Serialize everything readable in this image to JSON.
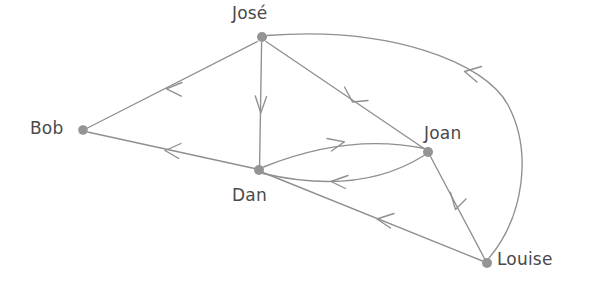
{
  "diagram": {
    "type": "directed-graph",
    "title": "",
    "canvas": {
      "width": 590,
      "height": 289
    },
    "style": {
      "background_color": "#ffffff",
      "node_color": "#949494",
      "edge_color": "#8f8f8f",
      "label_color": "#4a4a4a",
      "node_radius": 5,
      "edge_width": 1.35,
      "label_font_size": 17
    },
    "nodes": [
      {
        "id": "jose",
        "label": "José",
        "x": 262,
        "y": 37,
        "label_x": 232,
        "label_y": 4,
        "label_position": "above"
      },
      {
        "id": "bob",
        "label": "Bob",
        "x": 83,
        "y": 130,
        "label_x": 30,
        "label_y": 119,
        "label_position": "left"
      },
      {
        "id": "dan",
        "label": "Dan",
        "x": 259,
        "y": 170,
        "label_x": 232,
        "label_y": 186,
        "label_position": "below"
      },
      {
        "id": "joan",
        "label": "Joan",
        "x": 428,
        "y": 152,
        "label_x": 424,
        "label_y": 124,
        "label_position": "above-right"
      },
      {
        "id": "louise",
        "label": "Louise",
        "x": 487,
        "y": 263,
        "label_x": 497,
        "label_y": 250,
        "label_position": "right"
      }
    ],
    "edges": [
      {
        "id": "jose-bob",
        "source": "jose",
        "target": "bob",
        "directed": true,
        "shape": "straight",
        "arrow_at": "target"
      },
      {
        "id": "jose-dan",
        "source": "jose",
        "target": "dan",
        "directed": true,
        "shape": "straight",
        "arrow_at": "target"
      },
      {
        "id": "jose-joan",
        "source": "jose",
        "target": "joan",
        "directed": true,
        "shape": "straight",
        "arrow_at": "target"
      },
      {
        "id": "dan-bob",
        "source": "dan",
        "target": "bob",
        "directed": true,
        "shape": "straight",
        "arrow_at": "target"
      },
      {
        "id": "dan-joan",
        "source": "dan",
        "target": "joan",
        "directed": true,
        "shape": "curved-upper",
        "arrow_at": "target"
      },
      {
        "id": "joan-dan",
        "source": "joan",
        "target": "dan",
        "directed": true,
        "shape": "curved-lower",
        "arrow_at": "target"
      },
      {
        "id": "louise-joan",
        "source": "louise",
        "target": "joan",
        "directed": true,
        "shape": "straight",
        "arrow_at": "target"
      },
      {
        "id": "louise-dan",
        "source": "louise",
        "target": "dan",
        "directed": true,
        "shape": "straight",
        "arrow_at": "target"
      },
      {
        "id": "louise-jose",
        "source": "louise",
        "target": "jose",
        "directed": true,
        "shape": "curved-long-right",
        "arrow_at": "target"
      }
    ]
  }
}
